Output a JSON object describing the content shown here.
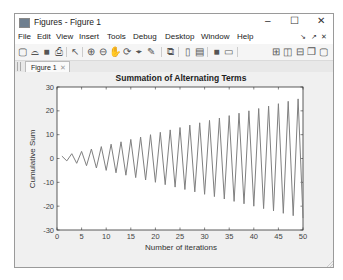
{
  "window": {
    "title": "Figures - Figure 1",
    "controls": {
      "minimize": "–",
      "maximize": "☐",
      "close": "✕"
    }
  },
  "menubar": {
    "items": [
      {
        "label": "File",
        "x": 3
      },
      {
        "label": "Edit",
        "x": 22
      },
      {
        "label": "View",
        "x": 41
      },
      {
        "label": "Insert",
        "x": 64
      },
      {
        "label": "Tools",
        "x": 92
      },
      {
        "label": "Debug",
        "x": 118
      },
      {
        "label": "Desktop",
        "x": 150
      },
      {
        "label": "Window",
        "x": 186
      },
      {
        "label": "Help",
        "x": 222
      }
    ],
    "dock_controls": [
      "↘",
      "↗",
      "✕"
    ]
  },
  "toolbar": {
    "buttons": [
      {
        "name": "new-figure",
        "glyph": "▢",
        "x": 2
      },
      {
        "name": "open-file",
        "glyph": "⌓",
        "x": 14
      },
      {
        "name": "save",
        "glyph": "■",
        "x": 26
      },
      {
        "name": "print",
        "glyph": "⎙",
        "x": 38
      },
      {
        "name": "edit-plot",
        "glyph": "↖",
        "x": 54
      },
      {
        "name": "zoom-in",
        "glyph": "⊕",
        "x": 70
      },
      {
        "name": "zoom-out",
        "glyph": "⊖",
        "x": 82
      },
      {
        "name": "pan",
        "glyph": "✋",
        "x": 94
      },
      {
        "name": "rotate-3d",
        "glyph": "⟳",
        "x": 106
      },
      {
        "name": "data-cursor",
        "glyph": "⌖",
        "x": 118
      },
      {
        "name": "brush",
        "glyph": "✎",
        "x": 130
      },
      {
        "name": "link-plot",
        "glyph": "⧉",
        "x": 150
      },
      {
        "name": "insert-colorbar",
        "glyph": "▯",
        "x": 167
      },
      {
        "name": "insert-legend",
        "glyph": "▤",
        "x": 179
      },
      {
        "name": "hide-plot-tools",
        "glyph": "■",
        "x": 196
      },
      {
        "name": "show-plot-tools",
        "glyph": "▭",
        "x": 208
      },
      {
        "name": "tile-grid",
        "glyph": "⊞",
        "x": 255
      },
      {
        "name": "tile-columns",
        "glyph": "◫",
        "x": 267
      },
      {
        "name": "tile-rows",
        "glyph": "⊟",
        "x": 279
      },
      {
        "name": "float",
        "glyph": "❐",
        "x": 291
      },
      {
        "name": "maximize-doc",
        "glyph": "▢",
        "x": 303
      }
    ]
  },
  "tabs": [
    {
      "label": "Figure 1",
      "close": "✕"
    }
  ],
  "chart_data": {
    "type": "line",
    "title": "Summation of Alternating Terms",
    "xlabel": "Number of iterations",
    "ylabel": "Cumulative Sum",
    "xlim": [
      0,
      50
    ],
    "ylim": [
      -30,
      30
    ],
    "xticks": [
      0,
      5,
      10,
      15,
      20,
      25,
      30,
      35,
      40,
      45,
      50
    ],
    "yticks": [
      30,
      20,
      10,
      0,
      -10,
      -20,
      -30
    ],
    "grid": false,
    "line_color": "#808080",
    "x": [
      1,
      2,
      3,
      4,
      5,
      6,
      7,
      8,
      9,
      10,
      11,
      12,
      13,
      14,
      15,
      16,
      17,
      18,
      19,
      20,
      21,
      22,
      23,
      24,
      25,
      26,
      27,
      28,
      29,
      30,
      31,
      32,
      33,
      34,
      35,
      36,
      37,
      38,
      39,
      40,
      41,
      42,
      43,
      44,
      45,
      46,
      47,
      48,
      49,
      50
    ],
    "values": [
      1,
      -1,
      2,
      -2,
      3,
      -3,
      4,
      -4,
      5,
      -5,
      6,
      -6,
      7,
      -7,
      8,
      -8,
      9,
      -9,
      10,
      -10,
      11,
      -11,
      12,
      -12,
      13,
      -13,
      14,
      -14,
      15,
      -15,
      16,
      -16,
      17,
      -17,
      18,
      -18,
      19,
      -19,
      20,
      -20,
      21,
      -21,
      22,
      -22,
      23,
      -23,
      24,
      -24,
      25,
      -25
    ]
  }
}
